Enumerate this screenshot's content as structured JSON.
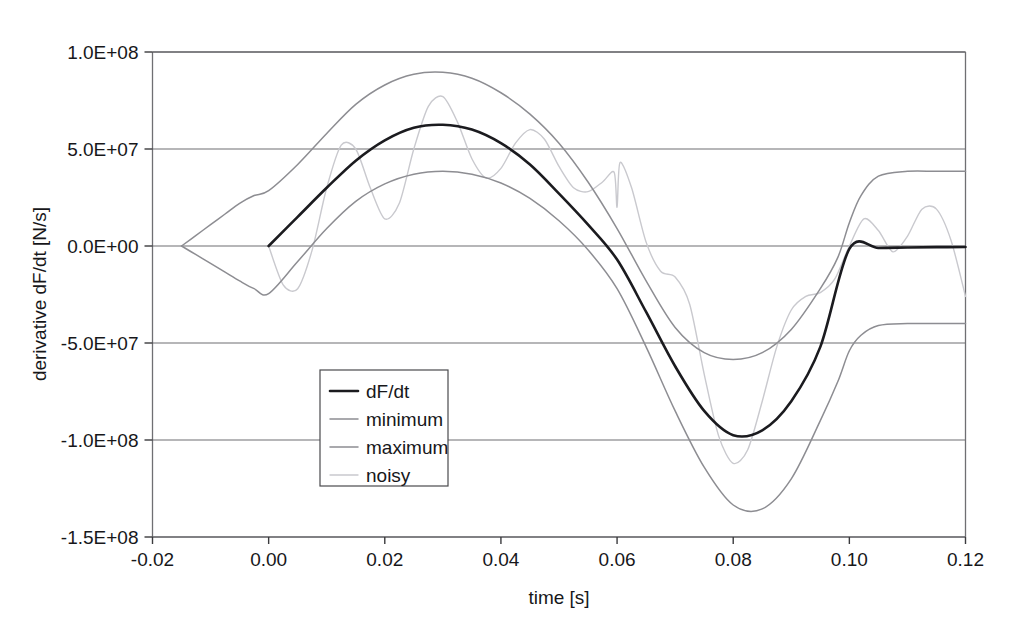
{
  "chart_data": {
    "type": "line",
    "title": "",
    "xlabel": "time [s]",
    "ylabel": "derivative dF/dt [N/s]",
    "xlim": [
      -0.02,
      0.12
    ],
    "ylim": [
      -150000000,
      100000000
    ],
    "grid": true,
    "legend_position": "center-left-inside",
    "x_ticks": [
      "-0.02",
      "0.00",
      "0.02",
      "0.04",
      "0.06",
      "0.08",
      "0.10",
      "0.12"
    ],
    "x_tick_values": [
      -0.02,
      0.0,
      0.02,
      0.04,
      0.06,
      0.08,
      0.1,
      0.12
    ],
    "y_ticks": [
      "1.0E+08",
      "5.0E+07",
      "0.0E+00",
      "-5.0E+07",
      "-1.0E+08",
      "-1.5E+08"
    ],
    "y_tick_values": [
      100000000,
      50000000,
      0,
      -50000000,
      -100000000,
      -150000000
    ],
    "series": [
      {
        "name": "dF/dt",
        "color": "#1b1b1f",
        "width": 2.6,
        "x": [
          0.0,
          0.005,
          0.01,
          0.015,
          0.02,
          0.025,
          0.03,
          0.035,
          0.04,
          0.045,
          0.05,
          0.055,
          0.06,
          0.065,
          0.07,
          0.075,
          0.08,
          0.085,
          0.09,
          0.095,
          0.1,
          0.105,
          0.11,
          0.115,
          0.12
        ],
        "y": [
          0,
          15000000,
          30000000,
          44000000,
          54500000,
          61000000,
          62500000,
          60000000,
          53000000,
          42000000,
          27000000,
          11000000,
          -7000000,
          -34000000,
          -62000000,
          -85000000,
          -97500000,
          -95000000,
          -80000000,
          -52000000,
          -1500000,
          -1000000,
          -800000,
          -600000,
          -500000
        ]
      },
      {
        "name": "minimum",
        "color": "#8d8d92",
        "width": 1.5,
        "x": [
          -0.015,
          -0.0125,
          -0.01,
          -0.0075,
          -0.005,
          -0.0025,
          0.0,
          0.005,
          0.01,
          0.015,
          0.02,
          0.025,
          0.03,
          0.035,
          0.04,
          0.045,
          0.05,
          0.055,
          0.06,
          0.065,
          0.07,
          0.075,
          0.08,
          0.085,
          0.09,
          0.095,
          0.098,
          0.1,
          0.102,
          0.105,
          0.11,
          0.115,
          0.12
        ],
        "y": [
          0,
          -4500000,
          -9000000,
          -13500000,
          -18000000,
          -22000000,
          -24500000,
          -8000000,
          9000000,
          23000000,
          32000000,
          37000000,
          38500000,
          37000000,
          32500000,
          24500000,
          13000000,
          -2000000,
          -22000000,
          -52000000,
          -85000000,
          -114000000,
          -133500000,
          -135500000,
          -120000000,
          -90000000,
          -70000000,
          -54000000,
          -46000000,
          -41000000,
          -40000000,
          -40000000,
          -40000000
        ]
      },
      {
        "name": "maximum",
        "color": "#8d8d92",
        "width": 1.5,
        "x": [
          -0.015,
          -0.0125,
          -0.01,
          -0.0075,
          -0.005,
          -0.0025,
          0.0,
          0.005,
          0.01,
          0.015,
          0.02,
          0.025,
          0.03,
          0.035,
          0.04,
          0.045,
          0.05,
          0.055,
          0.06,
          0.065,
          0.07,
          0.075,
          0.08,
          0.085,
          0.09,
          0.095,
          0.098,
          0.1,
          0.102,
          0.105,
          0.11,
          0.115,
          0.12
        ],
        "y": [
          0,
          5500000,
          11000000,
          16500000,
          22000000,
          26000000,
          28500000,
          42000000,
          58000000,
          73000000,
          83000000,
          88500000,
          89500000,
          86500000,
          79000000,
          68000000,
          53000000,
          33000000,
          9000000,
          -18000000,
          -42000000,
          -55000000,
          -58500000,
          -55000000,
          -43000000,
          -22000000,
          -6000000,
          12000000,
          26000000,
          36000000,
          38500000,
          38500000,
          38500000
        ]
      },
      {
        "name": "noisy",
        "color": "#c9c9ce",
        "width": 1.4,
        "x": [
          0.0,
          0.0025,
          0.005,
          0.0075,
          0.01,
          0.0125,
          0.015,
          0.0175,
          0.02,
          0.0225,
          0.025,
          0.0275,
          0.03,
          0.0325,
          0.035,
          0.0375,
          0.04,
          0.0425,
          0.045,
          0.0475,
          0.05,
          0.0525,
          0.055,
          0.0575,
          0.0595,
          0.06,
          0.0605,
          0.0625,
          0.065,
          0.0675,
          0.07,
          0.0725,
          0.075,
          0.0775,
          0.08,
          0.0825,
          0.085,
          0.0875,
          0.09,
          0.0925,
          0.095,
          0.0975,
          0.1,
          0.1025,
          0.105,
          0.1075,
          0.11,
          0.1125,
          0.115,
          0.1175,
          0.12
        ],
        "y": [
          0,
          -20000000,
          -22000000,
          -2000000,
          30000000,
          52000000,
          50000000,
          30000000,
          14000000,
          22000000,
          50000000,
          72000000,
          77000000,
          64000000,
          45000000,
          35000000,
          40000000,
          53000000,
          60000000,
          55000000,
          41000000,
          30000000,
          28000000,
          33000000,
          38000000,
          20000000,
          43000000,
          30000000,
          2000000,
          -13000000,
          -16000000,
          -30000000,
          -66000000,
          -98000000,
          -112000000,
          -105000000,
          -80000000,
          -52000000,
          -33000000,
          -26000000,
          -24000000,
          -17000000,
          0,
          14000000,
          8000000,
          -3000000,
          5000000,
          19000000,
          19000000,
          3000000,
          -26000000
        ]
      }
    ]
  },
  "legend": {
    "entries": [
      {
        "label": "dF/dt"
      },
      {
        "label": "minimum"
      },
      {
        "label": "maximum"
      },
      {
        "label": "noisy"
      }
    ]
  },
  "colors": {
    "series_primary": "#1b1b1f",
    "series_envelope": "#8d8d92",
    "series_noisy": "#c9c9ce",
    "grid": "#6f6f73",
    "text": "#17171a",
    "background": "#ffffff"
  }
}
